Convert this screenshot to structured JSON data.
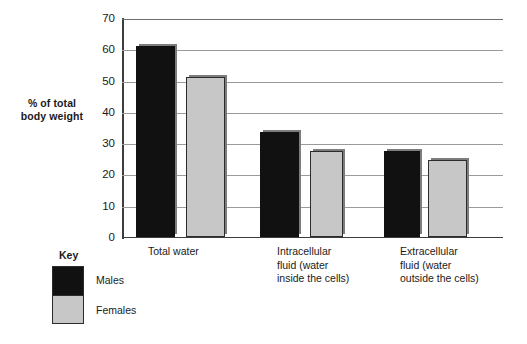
{
  "chart_data": {
    "type": "bar",
    "title": "",
    "xlabel": "",
    "ylabel": "% of total body weight",
    "ylim": [
      0,
      70
    ],
    "yticks": [
      0,
      10,
      20,
      30,
      40,
      50,
      60,
      70
    ],
    "grid": true,
    "legend_position": "bottom-left",
    "legend_title": "Key",
    "categories": [
      "Total water",
      "Intracellular fluid (water inside the cells)",
      "Extracellular fluid  (water outside the cells)"
    ],
    "category_lines": [
      [
        "Total water"
      ],
      [
        "Intracellular",
        "fluid (water",
        "inside the cells)"
      ],
      [
        "Extracellular",
        "fluid  (water",
        "outside the cells)"
      ]
    ],
    "series": [
      {
        "name": "Males",
        "color": "#111111",
        "values": [
          61,
          33.5,
          27.5
        ]
      },
      {
        "name": "Females",
        "color": "#c7c7c7",
        "values": [
          51,
          27.5,
          24.5
        ]
      }
    ]
  },
  "colors": {
    "males": "#111111",
    "females": "#c7c7c7",
    "axis": "#3d3d3d",
    "gridline": "#9a9a9a",
    "background": "#ffffff",
    "text": "#1a1a1a"
  },
  "axis": {
    "tick_0": "0",
    "tick_10": "10",
    "tick_20": "20",
    "tick_30": "30",
    "tick_40": "40",
    "tick_50": "50",
    "tick_60": "60",
    "tick_70": "70"
  },
  "legend": {
    "title": "Key",
    "males_label": "Males",
    "females_label": "Females"
  },
  "categories": {
    "g1_l1": "Total water",
    "g2_l1": "Intracellular",
    "g2_l2": "fluid (water",
    "g2_l3": "inside the cells)",
    "g3_l1": "Extracellular",
    "g3_l2": "fluid  (water",
    "g3_l3": "outside the cells)"
  },
  "y_axis_title": {
    "line1": "% of total",
    "line2": "body weight"
  }
}
